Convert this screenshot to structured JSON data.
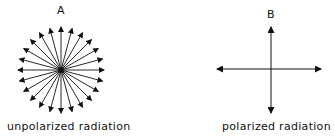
{
  "panels": [
    {
      "letter": "A",
      "caption": "unpolarized radiation",
      "type": "radial-arrows",
      "arrow_count": 24
    },
    {
      "letter": "B",
      "caption": "polarized radiation",
      "type": "cross-arrows",
      "arrow_count": 4
    }
  ],
  "colors": {
    "ink": "#111111",
    "background": "#ffffff"
  }
}
